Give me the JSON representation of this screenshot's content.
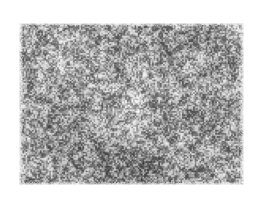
{
  "page": {
    "background_color": "#ffffff",
    "width": 263,
    "height": 199
  },
  "figure": {
    "kind": "photomicrograph",
    "caption": "",
    "label": "",
    "scale_bar": "",
    "has_text": false,
    "plate": {
      "left": 18,
      "top": 22,
      "width": 227,
      "height": 164,
      "border_style": "ragged-scan-edge",
      "rendering": "halftone-speckle"
    },
    "tone": {
      "mean_gray": "#9b9b9b",
      "light_tone": "#f2f2f2",
      "mid_tone": "#a5a5a5",
      "dark_tone": "#2e2e2e",
      "min_gray": "#141414",
      "max_gray": "#fdfdfd"
    },
    "texture": {
      "type": "high-frequency speckle",
      "grain_scale_px": 1.6,
      "blob_scale_px": 5.5,
      "cluster_scale_px": 26,
      "contrast": 0.92,
      "seed": 20240517
    },
    "regions": [
      {
        "name": "upper-left-field",
        "cx": 0.2,
        "cy": 0.22,
        "radius": 0.3,
        "tone": 0.06
      },
      {
        "name": "central-pale-field",
        "cx": 0.5,
        "cy": 0.5,
        "radius": 0.28,
        "tone": 0.1
      },
      {
        "name": "dark-focus-upper-right",
        "cx": 0.84,
        "cy": 0.29,
        "radius": 0.1,
        "tone": -0.22
      },
      {
        "name": "dark-band-lower-left",
        "cx": 0.26,
        "cy": 0.74,
        "radius": 0.22,
        "tone": -0.12
      },
      {
        "name": "dark-margin-bottom",
        "cx": 0.55,
        "cy": 0.97,
        "radius": 0.35,
        "tone": -0.14
      },
      {
        "name": "pale-corner-top-right",
        "cx": 0.95,
        "cy": 0.04,
        "radius": 0.12,
        "tone": 0.2
      }
    ]
  }
}
